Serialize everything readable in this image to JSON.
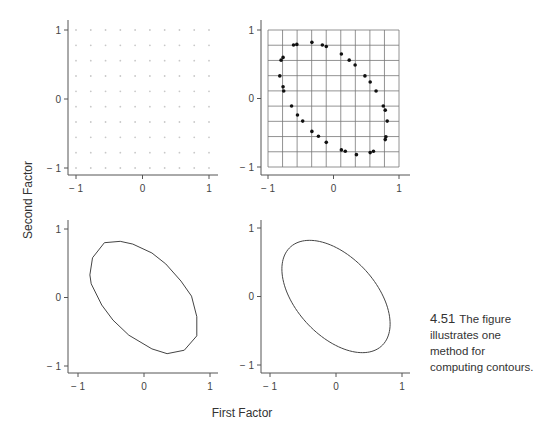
{
  "figure": {
    "caption_number": "4.51",
    "caption_lines": [
      "The figure",
      "illustrates one",
      "method for",
      "computing contours."
    ],
    "xlabel": "First Factor",
    "ylabel": "Second Factor"
  },
  "chart_data": [
    {
      "type": "scatter",
      "panel": "top-left",
      "title": "",
      "description": "regular grid of faint evaluation points",
      "grid_points": {
        "x_from": -1,
        "x_to": 1,
        "nx": 10,
        "y_from": -1,
        "y_to": 1,
        "ny": 10
      },
      "xlim": [
        -1.1,
        1.1
      ],
      "ylim": [
        -1.1,
        1.1
      ],
      "xticks": [
        -1,
        0,
        1
      ],
      "yticks": [
        -1,
        0,
        1
      ],
      "xtick_labels": [
        "− 1",
        "0",
        "1"
      ],
      "ytick_labels": [
        "− 1",
        "0",
        "1"
      ],
      "grid": false
    },
    {
      "type": "scatter",
      "panel": "top-right",
      "title": "",
      "description": "grid lines with points on contour",
      "grid_lines": {
        "x_from": -1,
        "x_to": 1,
        "nx": 10,
        "y_from": -1,
        "y_to": 1,
        "ny": 10
      },
      "points": [
        [
          -0.61,
          0.78
        ],
        [
          -0.56,
          0.79
        ],
        [
          -0.33,
          0.82
        ],
        [
          -0.17,
          0.78
        ],
        [
          -0.11,
          0.76
        ],
        [
          0.12,
          0.65
        ],
        [
          0.24,
          0.56
        ],
        [
          0.33,
          0.49
        ],
        [
          0.48,
          0.33
        ],
        [
          0.56,
          0.24
        ],
        [
          0.65,
          0.11
        ],
        [
          0.76,
          -0.11
        ],
        [
          0.79,
          -0.17
        ],
        [
          0.82,
          -0.33
        ],
        [
          0.8,
          -0.56
        ],
        [
          0.79,
          -0.6
        ],
        [
          0.61,
          -0.77
        ],
        [
          0.56,
          -0.79
        ],
        [
          0.35,
          -0.82
        ],
        [
          0.18,
          -0.77
        ],
        [
          0.12,
          -0.75
        ],
        [
          -0.11,
          -0.64
        ],
        [
          -0.23,
          -0.55
        ],
        [
          -0.33,
          -0.48
        ],
        [
          -0.47,
          -0.33
        ],
        [
          -0.55,
          -0.24
        ],
        [
          -0.64,
          -0.11
        ],
        [
          -0.76,
          0.11
        ],
        [
          -0.77,
          0.17
        ],
        [
          -0.82,
          0.33
        ],
        [
          -0.8,
          0.56
        ],
        [
          -0.77,
          0.6
        ]
      ],
      "xlim": [
        -1.1,
        1.1
      ],
      "ylim": [
        -1.1,
        1.1
      ],
      "xticks": [
        -1,
        0,
        1
      ],
      "yticks": [
        -1,
        0,
        1
      ],
      "xtick_labels": [
        "− 1",
        "0",
        "1"
      ],
      "ytick_labels": [
        "− 1",
        "0",
        "1"
      ],
      "grid": true
    },
    {
      "type": "line",
      "panel": "bottom-left",
      "title": "",
      "description": "polygonal contour connecting grid-derived points",
      "polygon": [
        [
          -0.6,
          0.8
        ],
        [
          -0.36,
          0.82
        ],
        [
          -0.17,
          0.78
        ],
        [
          0.12,
          0.65
        ],
        [
          0.33,
          0.49
        ],
        [
          0.56,
          0.24
        ],
        [
          0.72,
          0.02
        ],
        [
          0.8,
          -0.28
        ],
        [
          0.8,
          -0.56
        ],
        [
          0.61,
          -0.77
        ],
        [
          0.35,
          -0.82
        ],
        [
          0.12,
          -0.75
        ],
        [
          -0.23,
          -0.55
        ],
        [
          -0.47,
          -0.33
        ],
        [
          -0.64,
          -0.11
        ],
        [
          -0.8,
          0.2
        ],
        [
          -0.82,
          0.33
        ],
        [
          -0.78,
          0.58
        ]
      ],
      "xlim": [
        -1.1,
        1.1
      ],
      "ylim": [
        -1.1,
        1.1
      ],
      "xticks": [
        -1,
        0,
        1
      ],
      "yticks": [
        -1,
        0,
        1
      ],
      "xtick_labels": [
        "− 1",
        "0",
        "1"
      ],
      "ytick_labels": [
        "− 1",
        "0",
        "1"
      ],
      "grid": false
    },
    {
      "type": "line",
      "panel": "bottom-right",
      "title": "",
      "description": "smooth elliptical contour",
      "ellipse": {
        "cx": 0,
        "cy": 0,
        "semi_major": 1.0,
        "semi_minor": 0.587,
        "angle_deg": -45
      },
      "xlim": [
        -1.1,
        1.1
      ],
      "ylim": [
        -1.1,
        1.1
      ],
      "xticks": [
        -1,
        0,
        1
      ],
      "yticks": [
        -1,
        0,
        1
      ],
      "xtick_labels": [
        "− 1",
        "0",
        "1"
      ],
      "ytick_labels": [
        "− 1",
        "0",
        "1"
      ],
      "grid": false
    }
  ],
  "layout": {
    "panels": [
      {
        "yaxis_x": 68,
        "xaxis_y": 175,
        "x_m1": 76,
        "x_p1": 209,
        "y_p1": 30,
        "y_m1": 168,
        "axis_top": 20,
        "axis_right": 218
      },
      {
        "yaxis_x": 261,
        "xaxis_y": 175,
        "x_m1": 268,
        "x_p1": 399,
        "y_p1": 30,
        "y_m1": 167,
        "axis_top": 20,
        "axis_right": 410
      },
      {
        "yaxis_x": 68,
        "xaxis_y": 373,
        "x_m1": 78,
        "x_p1": 210,
        "y_p1": 229,
        "y_m1": 366,
        "axis_top": 220,
        "axis_right": 218
      },
      {
        "yaxis_x": 261,
        "xaxis_y": 373,
        "x_m1": 270,
        "x_p1": 402,
        "y_p1": 228,
        "y_m1": 365,
        "axis_top": 220,
        "axis_right": 410
      }
    ]
  }
}
